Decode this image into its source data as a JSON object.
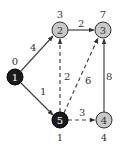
{
  "graph": {
    "nodes": [
      {
        "id": "1",
        "label": "1",
        "dist": "0",
        "x": 15,
        "y": 77,
        "fill": "#1a1a1a",
        "text_color": "#ffffff",
        "dist_pos": "above"
      },
      {
        "id": "2",
        "label": "2",
        "dist": "3",
        "x": 60,
        "y": 30,
        "fill": "#c8c8c8",
        "text_color": "#333333",
        "dist_pos": "above"
      },
      {
        "id": "3",
        "label": "3",
        "dist": "7",
        "x": 103,
        "y": 30,
        "fill": "#c8c8c8",
        "text_color": "#333333",
        "dist_pos": "above"
      },
      {
        "id": "4",
        "label": "4",
        "dist": "4",
        "x": 104,
        "y": 120,
        "fill": "#c8c8c8",
        "text_color": "#333333",
        "dist_pos": "below"
      },
      {
        "id": "5",
        "label": "5",
        "dist": "1",
        "x": 60,
        "y": 120,
        "fill": "#1a1a1a",
        "text_color": "#ffffff",
        "dist_pos": "below"
      }
    ],
    "edges": [
      {
        "from": "1",
        "to": "2",
        "weight": "4",
        "style": "solid"
      },
      {
        "from": "1",
        "to": "5",
        "weight": "1",
        "style": "solid"
      },
      {
        "from": "2",
        "to": "3",
        "weight": "2",
        "style": "solid"
      },
      {
        "from": "5",
        "to": "2",
        "weight": "2",
        "style": "dashed"
      },
      {
        "from": "5",
        "to": "3",
        "weight": "6",
        "style": "dashed"
      },
      {
        "from": "5",
        "to": "4",
        "weight": "3",
        "style": "dashed"
      },
      {
        "from": "4",
        "to": "3",
        "weight": "8",
        "style": "solid"
      }
    ]
  }
}
